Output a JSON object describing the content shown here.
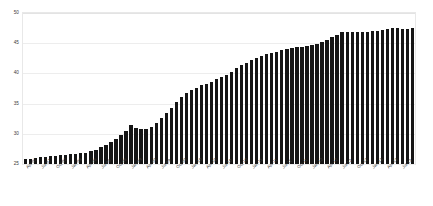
{
  "chart_data": {
    "type": "bar",
    "title": "",
    "subtitle": "",
    "xlabel": "",
    "ylabel": "",
    "ylim": [
      25,
      50
    ],
    "yticks": [
      25,
      30,
      35,
      40,
      45,
      50
    ],
    "grid": true,
    "legend": null,
    "legend_position": "none",
    "bar_color": "#151515",
    "gridline_color": "#ededed",
    "background_color": "#ffffff",
    "tick_label_rotation": -45,
    "label_interval": 3,
    "categories": [
      "Apr-07",
      "May-07",
      "Jun-07",
      "Jul-07",
      "Aug-07",
      "Sep-07",
      "Oct-07",
      "Nov-07",
      "Dec-07",
      "Jan-08",
      "Feb-08",
      "Mar-08",
      "Apr-08",
      "May-08",
      "Jun-08",
      "Jul-08",
      "Aug-08",
      "Sep-08",
      "Oct-08",
      "Nov-08",
      "Dec-08",
      "Jan-09",
      "Feb-09",
      "Mar-09",
      "Apr-09",
      "May-09",
      "Jun-09",
      "Jul-09",
      "Aug-09",
      "Sep-09",
      "Oct-09",
      "Nov-09",
      "Dec-09",
      "Jan-10",
      "Feb-10",
      "Mar-10",
      "Apr-10",
      "May-10",
      "Jun-10",
      "Jul-10",
      "Aug-10",
      "Sep-10",
      "Oct-10",
      "Nov-10",
      "Dec-10",
      "Jan-11",
      "Feb-11",
      "Mar-11",
      "Apr-11",
      "May-11",
      "Jun-11",
      "Jul-11",
      "Aug-11",
      "Sep-11",
      "Oct-11",
      "Nov-11",
      "Dec-11",
      "Jan-12",
      "Feb-12",
      "Mar-12",
      "Apr-12",
      "May-12",
      "Jun-12",
      "Jul-12",
      "Aug-12",
      "Sep-12",
      "Oct-12",
      "Nov-12",
      "Dec-12",
      "Jan-13",
      "Feb-13",
      "Mar-13",
      "Apr-13",
      "May-13",
      "Jun-13",
      "Jul-13",
      "Aug-13",
      "Sep-13"
    ],
    "values": [
      25.9,
      25.9,
      26.0,
      26.1,
      26.2,
      26.3,
      26.4,
      26.5,
      26.5,
      26.6,
      26.7,
      26.8,
      26.9,
      27.1,
      27.3,
      27.8,
      28.2,
      28.6,
      29.2,
      29.8,
      30.4,
      31.5,
      30.9,
      30.8,
      30.8,
      31.2,
      31.8,
      32.6,
      33.4,
      34.2,
      35.2,
      36.1,
      36.7,
      37.2,
      37.6,
      38.0,
      38.3,
      38.6,
      39.0,
      39.4,
      39.8,
      40.3,
      40.9,
      41.4,
      41.8,
      42.2,
      42.6,
      42.9,
      43.2,
      43.4,
      43.6,
      43.8,
      44.0,
      44.2,
      44.3,
      44.4,
      44.5,
      44.7,
      44.9,
      45.2,
      45.6,
      46.0,
      46.4,
      46.8,
      46.9,
      46.9,
      46.8,
      46.8,
      46.9,
      47.0,
      47.1,
      47.2,
      47.3,
      47.5,
      47.6,
      47.4,
      47.4,
      47.5
    ]
  }
}
